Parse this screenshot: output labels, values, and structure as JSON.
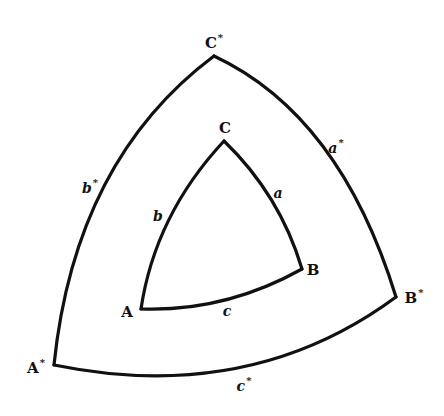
{
  "diagram": {
    "title": "",
    "outer_triangle": {
      "name": "polar triangle",
      "vertices": {
        "A*": {
          "label": "A",
          "mark": "*",
          "x": 54,
          "y": 365
        },
        "B*": {
          "label": "B",
          "mark": "*",
          "x": 396,
          "y": 297
        },
        "C*": {
          "label": "C",
          "mark": "*",
          "x": 214,
          "y": 56
        }
      },
      "sides": {
        "a*": {
          "label": "a",
          "mark": "*"
        },
        "b*": {
          "label": "b",
          "mark": "*"
        },
        "c*": {
          "label": "c",
          "mark": "*"
        }
      }
    },
    "inner_triangle": {
      "name": "spherical triangle",
      "vertices": {
        "A": {
          "label": "A",
          "x": 141,
          "y": 309
        },
        "B": {
          "label": "B",
          "x": 302,
          "y": 269
        },
        "C": {
          "label": "C",
          "x": 224,
          "y": 141
        }
      },
      "sides": {
        "a": {
          "label": "a"
        },
        "b": {
          "label": "b"
        },
        "c": {
          "label": "c"
        }
      }
    },
    "stroke_color": "#111111",
    "background_color": "#ffffff"
  }
}
